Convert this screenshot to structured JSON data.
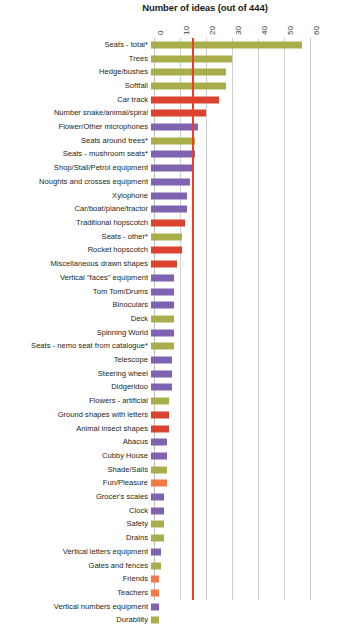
{
  "chart_data": {
    "type": "bar",
    "orientation": "horizontal",
    "title": "Number of ideas (out of 444)",
    "xlabel": "",
    "ylabel": "",
    "xlim": [
      0,
      60
    ],
    "xticks": [
      "0",
      "10",
      "20",
      "30",
      "40",
      "50",
      "60"
    ],
    "grid": true,
    "legend": "none",
    "reference_line": {
      "value": 14.6,
      "color": "#ef3e23",
      "label": ""
    },
    "colors": {
      "olive": "#a9ae4c",
      "red": "#d9432f",
      "purple": "#7f63b0",
      "orange": "#f47a45"
    },
    "categories": [
      "Seats - total*",
      "Trees",
      "Hedge/bushes",
      "Softfall",
      "Car track",
      "Number snake/animal/spiral",
      "Flower/Other microphones",
      "Seats around trees*",
      "Seats - mushroom seats*",
      "Shop/Stall/Petrol equipment",
      "Noughts and crosses equipment",
      "Xylophone",
      "Car/boat/plane/tractor",
      "Traditional hopscotch",
      "Seats - other*",
      "Rocket hopscotch",
      "Miscellaneous drawn shapes",
      "Vertical \"faces\" equipment",
      "Tom Tom/Drums",
      "Binoculars",
      "Deck",
      "Spinning World",
      "Seats - nemo seat from catalogue*",
      "Telescope",
      "Steering wheel",
      "Didgeridoo",
      "Flowers - artificial",
      "Ground shapes with letters",
      "Animal insect shapes",
      "Abacus",
      "Cubby House",
      "Shade/Sails",
      "Fun/Pleasure",
      "Grocer's scales",
      "Clock",
      "Safety",
      "Drains",
      "Vertical letters equipment",
      "Gates and fences",
      "Friends",
      "Teachers",
      "Vertical numbers equipment",
      "Durability"
    ],
    "values": [
      58,
      31,
      29,
      29,
      26,
      21,
      18,
      17,
      17,
      16,
      15,
      14,
      14,
      13,
      12,
      12,
      10,
      9,
      9,
      9,
      9,
      9,
      9,
      8,
      8,
      8,
      7,
      7,
      7,
      6,
      6,
      6,
      6,
      5,
      5,
      5,
      5,
      4,
      4,
      3,
      3,
      3,
      3
    ],
    "series_colors": [
      "olive",
      "olive",
      "olive",
      "olive",
      "red",
      "red",
      "purple",
      "olive",
      "purple",
      "purple",
      "purple",
      "purple",
      "purple",
      "red",
      "olive",
      "red",
      "red",
      "purple",
      "purple",
      "purple",
      "olive",
      "purple",
      "olive",
      "purple",
      "purple",
      "purple",
      "olive",
      "red",
      "red",
      "purple",
      "purple",
      "olive",
      "orange",
      "purple",
      "purple",
      "olive",
      "olive",
      "purple",
      "olive",
      "orange",
      "orange",
      "purple",
      "olive"
    ]
  }
}
